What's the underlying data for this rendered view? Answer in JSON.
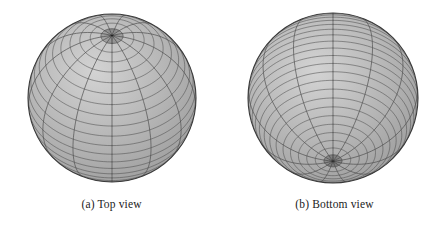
{
  "figure": {
    "background_color": "#ffffff",
    "panels": [
      {
        "id": "panel-a",
        "label": "(a) Top view",
        "view": "top",
        "sphere": {
          "center_x": 112,
          "center_y": 98,
          "radius": 84,
          "pole_visible": "north",
          "pole_x": 112,
          "pole_y": 42,
          "latitude_count": 24,
          "meridian_count": 13,
          "fill_color": "#b5b5b5",
          "fill_light": "#d3d3d3",
          "fill_dark": "#9a9a9a",
          "mesh_color": "#4f4f4f",
          "outline_color": "#3a3a3a"
        }
      },
      {
        "id": "panel-b",
        "label": "(b) Bottom view",
        "view": "bottom",
        "sphere": {
          "center_x": 110,
          "center_y": 98,
          "radius": 85,
          "pole_visible": "south",
          "pole_x": 110,
          "pole_y": 154,
          "latitude_count": 30,
          "meridian_count": 13,
          "fill_color": "#b5b5b5",
          "fill_light": "#d3d3d3",
          "fill_dark": "#9a9a9a",
          "mesh_color": "#4f4f4f",
          "outline_color": "#3a3a3a"
        }
      }
    ]
  }
}
